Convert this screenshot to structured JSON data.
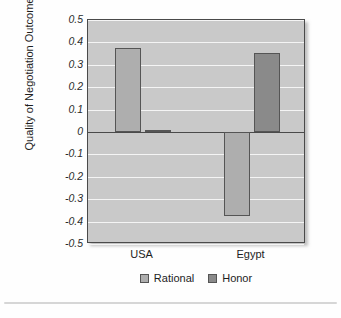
{
  "chart_data": {
    "type": "bar",
    "title": "",
    "xlabel": "",
    "ylabel": "Quality of Negotiation Outcome",
    "categories": [
      "USA",
      "Egypt"
    ],
    "series": [
      {
        "name": "Rational",
        "values": [
          0.375,
          -0.375
        ],
        "color": "#aeaeae"
      },
      {
        "name": "Honor",
        "values": [
          0.01,
          0.353
        ],
        "color": "#8a8a8a"
      }
    ],
    "ylim": [
      -0.5,
      0.5
    ],
    "yticks": [
      0.5,
      0.4,
      0.3,
      0.2,
      0.1,
      0,
      -0.1,
      -0.2,
      -0.3,
      -0.4,
      -0.5
    ],
    "ytick_labels": [
      "0.5",
      "0.4",
      "0.3",
      "0.2",
      "0.1",
      "0",
      "-0.1",
      "-0.2",
      "-0.3",
      "-0.4",
      "-0.5"
    ],
    "grid": true,
    "gridline_color": "#f4f4f4",
    "plot_background": "#c9c9c9",
    "legend_position": "bottom"
  },
  "legend": {
    "entries": [
      {
        "label": "Rational"
      },
      {
        "label": "Honor"
      }
    ]
  }
}
